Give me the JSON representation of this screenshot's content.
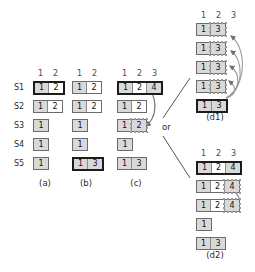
{
  "figure": {
    "or_label": "or",
    "row_labels": [
      "S1",
      "S2",
      "S3",
      "S4",
      "S5"
    ],
    "colors": {
      "cell_fill": "#d9d9d9",
      "cell_white": "#ffffff",
      "border": "#6b6b6b",
      "border_bold": "#1c1c1c",
      "dotted": "#9a9a9a",
      "arrow": "#707070",
      "text": "#1a1a1a"
    }
  },
  "panels": [
    {
      "id": "a",
      "caption": "(a)",
      "headers": [
        "1",
        "2"
      ],
      "show_row_labels": true,
      "rows": [
        {
          "label": "S1",
          "cells": [
            {
              "v": "1",
              "fill": "gray"
            },
            {
              "v": "2",
              "fill": "white"
            }
          ],
          "bold": true
        },
        {
          "label": "S2",
          "cells": [
            {
              "v": "1",
              "fill": "gray"
            },
            {
              "v": "2",
              "fill": "white"
            }
          ],
          "bold": false
        },
        {
          "label": "S3",
          "cells": [
            {
              "v": "1",
              "fill": "gray"
            }
          ],
          "bold": false
        },
        {
          "label": "S4",
          "cells": [
            {
              "v": "1",
              "fill": "gray"
            }
          ],
          "bold": false
        },
        {
          "label": "S5",
          "cells": [
            {
              "v": "1",
              "fill": "gray"
            }
          ],
          "bold": false
        }
      ]
    },
    {
      "id": "b",
      "caption": "(b)",
      "headers": [
        "1",
        "2"
      ],
      "show_row_labels": false,
      "rows": [
        {
          "label": "S1",
          "cells": [
            {
              "v": "1",
              "fill": "gray"
            },
            {
              "v": "2",
              "fill": "white"
            }
          ],
          "bold": false
        },
        {
          "label": "S2",
          "cells": [
            {
              "v": "1",
              "fill": "gray"
            },
            {
              "v": "2",
              "fill": "white"
            }
          ],
          "bold": false
        },
        {
          "label": "S3",
          "cells": [
            {
              "v": "1",
              "fill": "gray"
            }
          ],
          "bold": false
        },
        {
          "label": "S4",
          "cells": [
            {
              "v": "1",
              "fill": "gray"
            }
          ],
          "bold": false
        },
        {
          "label": "S5",
          "cells": [
            {
              "v": "1",
              "fill": "gray"
            },
            {
              "v": "3",
              "fill": "gray"
            }
          ],
          "bold": true
        }
      ]
    },
    {
      "id": "c",
      "caption": "(c)",
      "headers": [
        "1",
        "2",
        "3"
      ],
      "show_row_labels": false,
      "rows": [
        {
          "label": "S1",
          "cells": [
            {
              "v": "1",
              "fill": "gray"
            },
            {
              "v": "2",
              "fill": "white"
            },
            {
              "v": "4",
              "fill": "gray"
            }
          ],
          "bold": true
        },
        {
          "label": "S2",
          "cells": [
            {
              "v": "1",
              "fill": "gray"
            },
            {
              "v": "2",
              "fill": "white"
            }
          ],
          "bold": false
        },
        {
          "label": "S3",
          "cells": [
            {
              "v": "1",
              "fill": "gray"
            },
            {
              "v": "2",
              "fill": "gray",
              "dotted": true
            }
          ],
          "bold": false
        },
        {
          "label": "S4",
          "cells": [
            {
              "v": "1",
              "fill": "gray"
            }
          ],
          "bold": false
        },
        {
          "label": "S5",
          "cells": [
            {
              "v": "1",
              "fill": "gray"
            },
            {
              "v": "3",
              "fill": "gray"
            }
          ],
          "bold": false
        }
      ]
    },
    {
      "id": "d1",
      "caption": "(d1)",
      "headers": [
        "1",
        "2",
        "3"
      ],
      "show_row_labels": false,
      "rows": [
        {
          "label": "S1",
          "cells": [
            {
              "v": "1",
              "fill": "gray"
            },
            {
              "v": "3",
              "fill": "gray",
              "dotted": true
            }
          ],
          "bold": false
        },
        {
          "label": "S2",
          "cells": [
            {
              "v": "1",
              "fill": "gray"
            },
            {
              "v": "3",
              "fill": "gray",
              "dotted": true
            }
          ],
          "bold": false
        },
        {
          "label": "S3",
          "cells": [
            {
              "v": "1",
              "fill": "gray"
            },
            {
              "v": "3",
              "fill": "gray",
              "dotted": true
            }
          ],
          "bold": false
        },
        {
          "label": "S4",
          "cells": [
            {
              "v": "1",
              "fill": "gray"
            },
            {
              "v": "3",
              "fill": "gray",
              "dotted": true
            }
          ],
          "bold": false
        },
        {
          "label": "S5",
          "cells": [
            {
              "v": "1",
              "fill": "gray"
            },
            {
              "v": "3",
              "fill": "gray"
            }
          ],
          "bold": true
        }
      ]
    },
    {
      "id": "d2",
      "caption": "(d2)",
      "headers": [
        "1",
        "2",
        "3"
      ],
      "show_row_labels": false,
      "rows": [
        {
          "label": "S1",
          "cells": [
            {
              "v": "1",
              "fill": "gray"
            },
            {
              "v": "2",
              "fill": "white"
            },
            {
              "v": "4",
              "fill": "gray"
            }
          ],
          "bold": true
        },
        {
          "label": "S2",
          "cells": [
            {
              "v": "1",
              "fill": "gray"
            },
            {
              "v": "2",
              "fill": "white"
            },
            {
              "v": "4",
              "fill": "gray",
              "dotted": true
            }
          ],
          "bold": false
        },
        {
          "label": "S3",
          "cells": [
            {
              "v": "1",
              "fill": "gray"
            },
            {
              "v": "2",
              "fill": "white"
            },
            {
              "v": "4",
              "fill": "gray",
              "dotted": true
            }
          ],
          "bold": false
        },
        {
          "label": "S4",
          "cells": [
            {
              "v": "1",
              "fill": "gray"
            }
          ],
          "bold": false
        },
        {
          "label": "S5",
          "cells": [
            {
              "v": "1",
              "fill": "gray"
            },
            {
              "v": "3",
              "fill": "gray"
            }
          ],
          "bold": false
        }
      ]
    }
  ]
}
